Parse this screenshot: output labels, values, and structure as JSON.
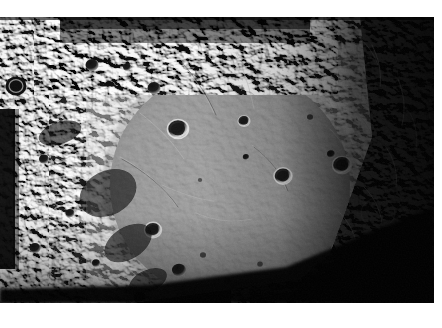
{
  "document": {
    "type": "photograph",
    "subject": "planetary impact basin surface",
    "palette": "grayscale",
    "page_background": "#ffffff"
  },
  "photo": {
    "frame": {
      "x": 0,
      "y": 17,
      "width": 434,
      "height": 286
    },
    "background_color": "#000000",
    "illumination": {
      "sun_direction": "upper-left",
      "terminator": "lower-right",
      "bright_tone": "#d8d8d8",
      "mid_tone": "#8a8a8a",
      "dark_tone": "#141414",
      "shadow_tone": "#050505"
    },
    "regions": [
      {
        "name": "rugged-rim-terrain-left",
        "tone": "#9a9a9a",
        "texture": "hummocky"
      },
      {
        "name": "basin-floor-center",
        "tone": "#7f7f7f",
        "texture": "smooth-plains"
      },
      {
        "name": "basin-rim-ring",
        "tone": "#a5a5a5",
        "texture": "mountainous"
      },
      {
        "name": "shadowed-terrain-right",
        "tone": "#101010",
        "texture": "dark-limb"
      },
      {
        "name": "terminator-shadow-bottom",
        "tone": "#060606",
        "texture": "flat-shadow"
      }
    ],
    "craters": [
      {
        "cx": 16,
        "cy": 69,
        "r": 10.5,
        "tone": "dark",
        "label": "crater-left-rim-large"
      },
      {
        "cx": 92,
        "cy": 48,
        "r": 6.5,
        "tone": "dark",
        "label": "crater-upper-left"
      },
      {
        "cx": 127,
        "cy": 50,
        "r": 4.0,
        "tone": "dark",
        "label": "crater-upper-left-small"
      },
      {
        "cx": 154,
        "cy": 71,
        "r": 6.5,
        "tone": "dark",
        "label": "crater-upper-mid"
      },
      {
        "cx": 178,
        "cy": 112,
        "r": 10.5,
        "tone": "bright-rim",
        "label": "crater-basin-nw"
      },
      {
        "cx": 244,
        "cy": 104,
        "r": 6.0,
        "tone": "bright-rim",
        "label": "crater-basin-n"
      },
      {
        "cx": 246,
        "cy": 140,
        "r": 3.2,
        "tone": "dark",
        "label": "crater-basin-center-small"
      },
      {
        "cx": 283,
        "cy": 159,
        "r": 9.0,
        "tone": "bright-rim",
        "label": "crater-basin-e"
      },
      {
        "cx": 331,
        "cy": 137,
        "r": 4.0,
        "tone": "dark",
        "label": "crater-ring-ne-small"
      },
      {
        "cx": 342,
        "cy": 148,
        "r": 9.5,
        "tone": "bright-rim",
        "label": "crater-ring-e-large"
      },
      {
        "cx": 153,
        "cy": 213,
        "r": 8.5,
        "tone": "bright-rim",
        "label": "crater-basin-sw"
      },
      {
        "cx": 179,
        "cy": 253,
        "r": 7.0,
        "tone": "dark",
        "label": "crater-basin-s"
      },
      {
        "cx": 140,
        "cy": 281,
        "r": 6.5,
        "tone": "dark",
        "label": "crater-south-rim"
      },
      {
        "cx": 186,
        "cy": 291,
        "r": 5.0,
        "tone": "dark",
        "label": "crater-south-edge"
      },
      {
        "cx": 203,
        "cy": 238,
        "r": 3.0,
        "tone": "dark",
        "label": "crater-floor-tiny-a"
      },
      {
        "cx": 228,
        "cy": 264,
        "r": 3.5,
        "tone": "dark",
        "label": "crater-floor-tiny-b"
      },
      {
        "cx": 260,
        "cy": 247,
        "r": 2.8,
        "tone": "dark",
        "label": "crater-floor-tiny-c"
      },
      {
        "cx": 200,
        "cy": 163,
        "r": 2.2,
        "tone": "dark",
        "label": "crater-floor-tiny-d"
      },
      {
        "cx": 310,
        "cy": 100,
        "r": 3.0,
        "tone": "dark",
        "label": "crater-ne-tiny"
      },
      {
        "cx": 44,
        "cy": 142,
        "r": 5.0,
        "tone": "dark",
        "label": "crater-west-a"
      },
      {
        "cx": 70,
        "cy": 196,
        "r": 4.5,
        "tone": "dark",
        "label": "crater-west-b"
      },
      {
        "cx": 35,
        "cy": 231,
        "r": 5.5,
        "tone": "dark",
        "label": "crater-southwest-a"
      },
      {
        "cx": 96,
        "cy": 246,
        "r": 4.0,
        "tone": "dark",
        "label": "crater-southwest-b"
      }
    ],
    "features": [
      {
        "name": "basin-rim-ring-outline",
        "type": "ring",
        "cx": 232,
        "cy": 170,
        "rx": 128,
        "ry": 122
      },
      {
        "name": "inner-ring-ridge",
        "type": "arc",
        "cx": 228,
        "cy": 168,
        "rx": 92,
        "ry": 88
      },
      {
        "name": "radial-graben-nw",
        "type": "lineament"
      },
      {
        "name": "radial-graben-n",
        "type": "lineament"
      },
      {
        "name": "wrinkle-ridge-center",
        "type": "lineament"
      },
      {
        "name": "dark-limb-shadow-left-band",
        "type": "shadow-band"
      },
      {
        "name": "terminator-diagonal-bottom",
        "type": "shadow-band"
      }
    ]
  }
}
